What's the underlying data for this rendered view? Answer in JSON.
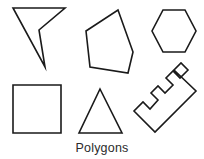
{
  "figure": {
    "caption": "Polygons",
    "width": 204,
    "height": 159,
    "background_color": "#ffffff",
    "stroke_color": "#1a1a1a",
    "stroke_width": 1.6
  },
  "shapes": [
    {
      "id": "arrow-dart",
      "name": "concave-quadrilateral-arrow",
      "sides": 4,
      "convex": false,
      "points": "13,8 65,8 39,30 45,67"
    },
    {
      "id": "pentagon",
      "name": "irregular-pentagon",
      "sides": 5,
      "convex": true,
      "points": "118,10 133,52 128,73 90,67 86,31"
    },
    {
      "id": "hexagon",
      "name": "regular-hexagon",
      "sides": 6,
      "convex": true,
      "points": "163,10 185,10 196,31 185,52 163,52 152,31"
    },
    {
      "id": "square",
      "name": "square",
      "sides": 4,
      "convex": true,
      "points": "13,85 61,85 61,133 13,133"
    },
    {
      "id": "triangle",
      "name": "isosceles-triangle",
      "sides": 3,
      "convex": true,
      "points": "100,89 122,133 79,133"
    },
    {
      "id": "ruler-comb",
      "name": "rotated-comb-polygon",
      "sides": 20,
      "convex": false,
      "points": "174,70 196,91 155,132 134,111 143,102 150,109 158,100 151,93 158,86 165,93 173,85 166,78 173,71 180,78 188,70 181,63"
    }
  ]
}
